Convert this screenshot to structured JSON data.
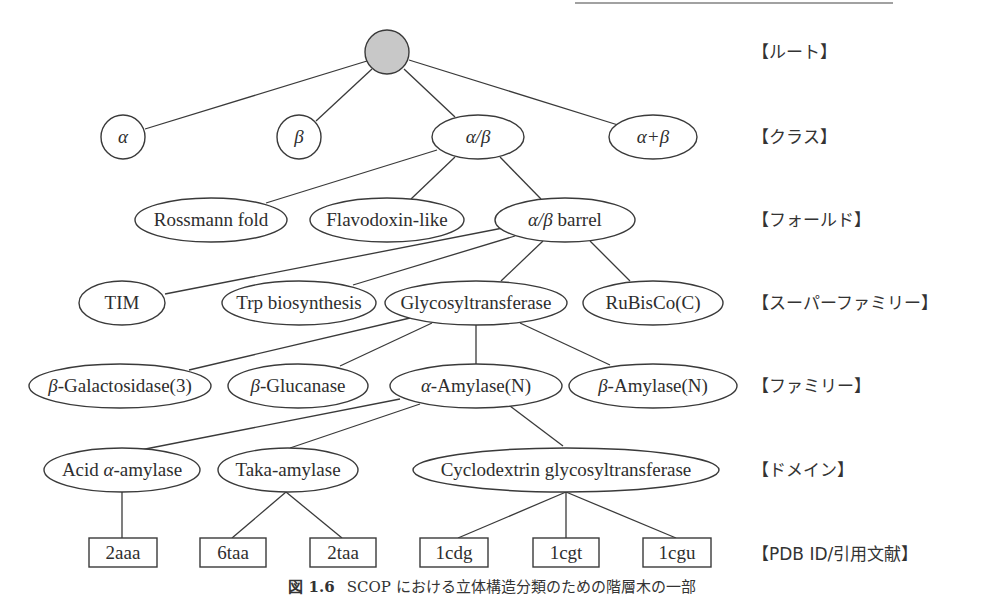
{
  "diagram": {
    "levels": [
      {
        "key": "root",
        "label": "【ルート】",
        "y": 52
      },
      {
        "key": "class",
        "label": "【クラス】",
        "y": 137
      },
      {
        "key": "fold",
        "label": "【フォールド】",
        "y": 220
      },
      {
        "key": "superfamily",
        "label": "【スーパーファミリー】",
        "y": 303
      },
      {
        "key": "family",
        "label": "【ファミリー】",
        "y": 386
      },
      {
        "key": "domain",
        "label": "【ドメイン】",
        "y": 469
      },
      {
        "key": "pdb",
        "label": "【PDB ID/引用文献】",
        "y": 553
      }
    ],
    "nodes": {
      "root": {
        "label": "",
        "shape": "circle",
        "fill": "#c8c8c8"
      },
      "class_alpha": {
        "label": "α",
        "shape": "circle"
      },
      "class_beta": {
        "label": "β",
        "shape": "circle"
      },
      "class_alpha_beta": {
        "label": "α/β",
        "shape": "ellipse"
      },
      "class_alpha_plus_beta": {
        "label": "α+β",
        "shape": "ellipse"
      },
      "fold_rossmann": {
        "label": "Rossmann fold",
        "shape": "ellipse"
      },
      "fold_flavodoxin": {
        "label": "Flavodoxin-like",
        "shape": "ellipse"
      },
      "fold_barrel": {
        "label_greek": "α/β",
        "label_rest": " barrel",
        "shape": "ellipse"
      },
      "sf_tim": {
        "label": "TIM",
        "shape": "ellipse"
      },
      "sf_trp": {
        "label": "Trp biosynthesis",
        "shape": "ellipse"
      },
      "sf_glyco": {
        "label": "Glycosyltransferase",
        "shape": "ellipse"
      },
      "sf_rubisco": {
        "label": "RuBisCo(C)",
        "shape": "ellipse"
      },
      "fam_bgal": {
        "label_greek": "β",
        "label_rest": "-Galactosidase(3)",
        "shape": "ellipse"
      },
      "fam_bglu": {
        "label_greek": "β",
        "label_rest": "-Glucanase",
        "shape": "ellipse"
      },
      "fam_aamy": {
        "label_greek": "α",
        "label_rest": "-Amylase(N)",
        "shape": "ellipse"
      },
      "fam_bamy": {
        "label_greek": "β",
        "label_rest": "-Amylase(N)",
        "shape": "ellipse"
      },
      "dom_acid": {
        "label_pre": "Acid ",
        "label_greek": "α",
        "label_rest": "-amylase",
        "shape": "ellipse"
      },
      "dom_taka": {
        "label": "Taka-amylase",
        "shape": "ellipse"
      },
      "dom_cyclo": {
        "label": "Cyclodextrin glycosyltransferase",
        "shape": "ellipse"
      },
      "pdb_2aaa": {
        "label": "2aaa",
        "shape": "rect"
      },
      "pdb_6taa": {
        "label": "6taa",
        "shape": "rect"
      },
      "pdb_2taa": {
        "label": "2taa",
        "shape": "rect"
      },
      "pdb_1cdg": {
        "label": "1cdg",
        "shape": "rect"
      },
      "pdb_1cgt": {
        "label": "1cgt",
        "shape": "rect"
      },
      "pdb_1cgu": {
        "label": "1cgu",
        "shape": "rect"
      }
    },
    "edges": [
      [
        "root",
        "class_alpha"
      ],
      [
        "root",
        "class_beta"
      ],
      [
        "root",
        "class_alpha_beta"
      ],
      [
        "root",
        "class_alpha_plus_beta"
      ],
      [
        "class_alpha_beta",
        "fold_rossmann"
      ],
      [
        "class_alpha_beta",
        "fold_flavodoxin"
      ],
      [
        "class_alpha_beta",
        "fold_barrel"
      ],
      [
        "fold_barrel",
        "sf_tim"
      ],
      [
        "fold_barrel",
        "sf_trp"
      ],
      [
        "fold_barrel",
        "sf_glyco"
      ],
      [
        "fold_barrel",
        "sf_rubisco"
      ],
      [
        "sf_glyco",
        "fam_bgal"
      ],
      [
        "sf_glyco",
        "fam_bglu"
      ],
      [
        "sf_glyco",
        "fam_aamy"
      ],
      [
        "sf_glyco",
        "fam_bamy"
      ],
      [
        "fam_aamy",
        "dom_acid"
      ],
      [
        "fam_aamy",
        "dom_taka"
      ],
      [
        "fam_aamy",
        "dom_cyclo"
      ],
      [
        "dom_acid",
        "pdb_2aaa"
      ],
      [
        "dom_taka",
        "pdb_6taa"
      ],
      [
        "dom_taka",
        "pdb_2taa"
      ],
      [
        "dom_cyclo",
        "pdb_1cdg"
      ],
      [
        "dom_cyclo",
        "pdb_1cgt"
      ],
      [
        "dom_cyclo",
        "pdb_1cgu"
      ]
    ]
  },
  "caption": {
    "figure_label": "図 1.6",
    "text": "SCOP における立体構造分類のための階層木の一部"
  }
}
